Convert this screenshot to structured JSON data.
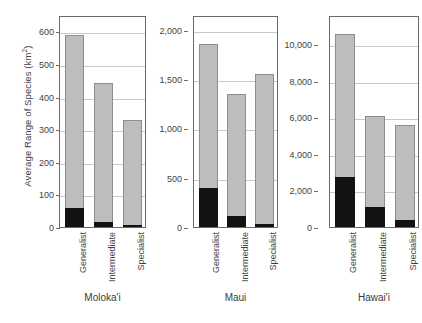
{
  "chart_data": {
    "type": "bar",
    "title": "",
    "subtitle": "",
    "xlabel": "",
    "ylabel": "Average Range of Species (km",
    "ylabel_superscript": "2",
    "ylabel_suffix": ")",
    "stacked": true,
    "grid": true,
    "legend": "none",
    "categories": [
      "Generalist",
      "Intermediate",
      "Specialist"
    ],
    "series": [
      {
        "name": "lower-segment",
        "color": "#121212"
      },
      {
        "name": "upper-segment",
        "color": "#bdbdbd"
      }
    ],
    "panels": [
      {
        "name": "Moloka'i",
        "ylim": [
          0,
          650
        ],
        "yticks": [
          0,
          100,
          200,
          300,
          400,
          500,
          600
        ],
        "ytick_labels": [
          "0",
          "100",
          "200",
          "300",
          "400",
          "500",
          "600"
        ],
        "bars": [
          {
            "category": "Generalist",
            "total": 590,
            "lower": 58,
            "upper": 532
          },
          {
            "category": "Intermediate",
            "total": 443,
            "lower": 15,
            "upper": 428
          },
          {
            "category": "Specialist",
            "total": 328,
            "lower": 2,
            "upper": 326
          }
        ]
      },
      {
        "name": "Maui",
        "ylim": [
          0,
          2150
        ],
        "yticks": [
          0,
          500,
          1000,
          1500,
          2000
        ],
        "ytick_labels": [
          "0",
          "500",
          "1,000",
          "1,500",
          "2,000"
        ],
        "bars": [
          {
            "category": "Generalist",
            "total": 1855,
            "lower": 400,
            "upper": 1455
          },
          {
            "category": "Intermediate",
            "total": 1350,
            "lower": 110,
            "upper": 1240
          },
          {
            "category": "Specialist",
            "total": 1550,
            "lower": 30,
            "upper": 1520
          }
        ]
      },
      {
        "name": "Hawai'i",
        "ylim": [
          0,
          11600
        ],
        "yticks": [
          0,
          2000,
          4000,
          6000,
          8000,
          10000
        ],
        "ytick_labels": [
          "0",
          "2,000",
          "4,000",
          "6,000",
          "8,000",
          "10,000"
        ],
        "bars": [
          {
            "category": "Generalist",
            "total": 10550,
            "lower": 2730,
            "upper": 7820
          },
          {
            "category": "Intermediate",
            "total": 6050,
            "lower": 1080,
            "upper": 4970
          },
          {
            "category": "Specialist",
            "total": 5600,
            "lower": 380,
            "upper": 5220
          }
        ]
      }
    ]
  },
  "colors": {
    "bar_upper": "#bdbdbd",
    "bar_lower": "#121212",
    "bar_stroke": "#8e8e8e",
    "gridline": "#c9c9c9",
    "axis": "#6a6a6a",
    "text": "#3f3f3f",
    "background": "#ffffff"
  }
}
